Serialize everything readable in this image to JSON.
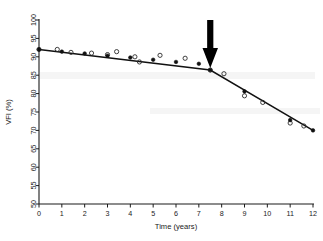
{
  "chart_data": {
    "type": "line",
    "title": "",
    "subtitle": "",
    "xlabel": "Time (years)",
    "ylabel": "VFI (%)",
    "xlim": [
      0,
      12
    ],
    "ylim": [
      50,
      100
    ],
    "xticks": [
      0,
      1,
      2,
      3,
      4,
      5,
      6,
      7,
      8,
      9,
      10,
      11,
      12
    ],
    "yticks": [
      50,
      55,
      60,
      65,
      70,
      75,
      80,
      85,
      90,
      95,
      100
    ],
    "grid": false,
    "legend": "none",
    "series": [
      {
        "name": "Observed VFI",
        "marker": "open-circle",
        "points": [
          {
            "x": 0.0,
            "y": 92.0
          },
          {
            "x": 0.8,
            "y": 92.0
          },
          {
            "x": 1.4,
            "y": 91.2
          },
          {
            "x": 2.3,
            "y": 91.0
          },
          {
            "x": 3.0,
            "y": 90.6
          },
          {
            "x": 3.4,
            "y": 91.4
          },
          {
            "x": 4.2,
            "y": 90.0
          },
          {
            "x": 4.4,
            "y": 88.6
          },
          {
            "x": 5.3,
            "y": 90.4
          },
          {
            "x": 6.4,
            "y": 89.6
          },
          {
            "x": 7.5,
            "y": 86.4
          },
          {
            "x": 8.1,
            "y": 85.4
          },
          {
            "x": 9.0,
            "y": 79.4
          },
          {
            "x": 9.8,
            "y": 77.6
          },
          {
            "x": 11.0,
            "y": 72.0
          },
          {
            "x": 11.6,
            "y": 71.2
          }
        ]
      },
      {
        "name": "Fitted segmented regression",
        "marker": "filled-circle",
        "points": [
          {
            "x": 0.0,
            "y": 92.0
          },
          {
            "x": 1.0,
            "y": 91.4
          },
          {
            "x": 2.0,
            "y": 90.9
          },
          {
            "x": 3.0,
            "y": 90.3
          },
          {
            "x": 4.0,
            "y": 89.8
          },
          {
            "x": 5.0,
            "y": 89.2
          },
          {
            "x": 6.0,
            "y": 88.6
          },
          {
            "x": 7.0,
            "y": 88.1
          },
          {
            "x": 7.5,
            "y": 86.4
          },
          {
            "x": 9.0,
            "y": 80.6
          },
          {
            "x": 11.0,
            "y": 72.8
          },
          {
            "x": 12.0,
            "y": 70.0
          }
        ]
      }
    ],
    "fit_line": [
      {
        "x": 0.0,
        "y": 92.0
      },
      {
        "x": 7.5,
        "y": 86.4
      },
      {
        "x": 12.0,
        "y": 70.0
      }
    ],
    "annotations": [
      {
        "type": "arrow",
        "name": "breakpoint-arrow",
        "direction": "down",
        "x": 7.5,
        "label": ""
      }
    ]
  },
  "axes": {
    "x": {
      "title": "Time (years)",
      "tick_labels": [
        "0",
        "1",
        "2",
        "3",
        "4",
        "5",
        "6",
        "7",
        "8",
        "9",
        "10",
        "11",
        "12"
      ]
    },
    "y": {
      "title": "VFI (%)",
      "tick_labels": [
        "50",
        "55",
        "60",
        "65",
        "70",
        "75",
        "80",
        "85",
        "90",
        "95",
        "100"
      ]
    }
  },
  "colors": {
    "line": "#111111",
    "marker_open": "#2a2a2a",
    "marker_filled": "#111111",
    "arrow": "#000000",
    "axis": "#1a1a1a",
    "background": "#ffffff"
  }
}
